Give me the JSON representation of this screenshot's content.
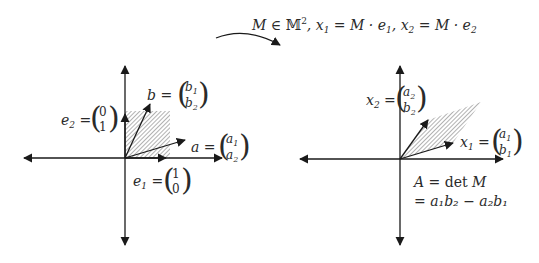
{
  "top": {
    "formula_M": "M",
    "formula_in": "∈",
    "formula_set": "𝕄",
    "formula_sup": "2",
    "formula_rest1": ", x",
    "formula_sub1": "1",
    "formula_eq1": " = M · e",
    "formula_sub1b": "1",
    "formula_rest2": ", x",
    "formula_sub2": "2",
    "formula_eq2": " = M · e",
    "formula_sub2b": "2"
  },
  "left": {
    "b_label": "b =",
    "b_top": "b",
    "b_top_sub": "1",
    "b_bot": "b",
    "b_bot_sub": "2",
    "e2_label": "e",
    "e2_sub": "2",
    "e2_eq": " =",
    "e2_top": "0",
    "e2_bot": "1",
    "a_label": "a =",
    "a_top": "a",
    "a_top_sub": "1",
    "a_bot": "a",
    "a_bot_sub": "2",
    "e1_label": "e",
    "e1_sub": "1",
    "e1_eq": " =",
    "e1_top": "1",
    "e1_bot": "0"
  },
  "right": {
    "x2_label": "x",
    "x2_sub": "2",
    "x2_eq": " =",
    "x2_top": "a",
    "x2_top_sub": "2",
    "x2_bot": "b",
    "x2_bot_sub": "2",
    "x1_label": "x",
    "x1_sub": "1",
    "x1_eq": " =",
    "x1_top": "a",
    "x1_top_sub": "1",
    "x1_bot": "b",
    "x1_bot_sub": "1",
    "area_line1_A": "A",
    "area_line1_eq": " = det ",
    "area_line1_M": "M",
    "area_line2": "= a₁b₂ − a₂b₁"
  },
  "colors": {
    "ink": "#1a1a1a",
    "hatch": "#555555"
  }
}
